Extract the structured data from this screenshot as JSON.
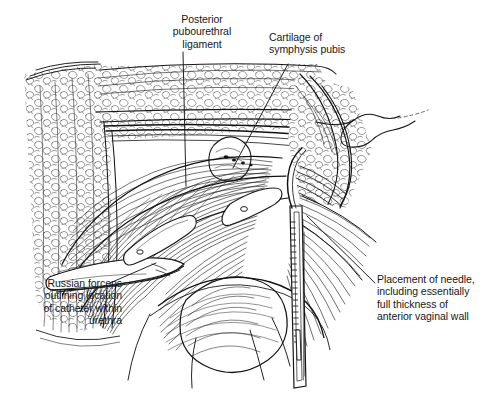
{
  "figure": {
    "style": "pen-and-ink line-hatching medical illustration",
    "background_color": "#ffffff",
    "ink_color": "#17171a",
    "width": 495,
    "height": 399
  },
  "labels": {
    "posterior_pubourethral_ligament": "Posterior\npubourethral\nligament",
    "cartilage_of_symphysis_pubis": "Cartilage of\nsymphysis pubis",
    "russian_forceps": "Russian forceps\noutlining location\nof catheter within\nurethra",
    "placement_of_needle": "Placement of needle,\nincluding essentially\nfull thickness of\nanterior vaginal wall"
  },
  "leader_lines": [
    {
      "name": "leader-posterior-pubourethral-ligament",
      "from": [
        183,
        52
      ],
      "to": [
        186,
        186
      ]
    },
    {
      "name": "leader-cartilage-of-symphysis-pubis",
      "from": [
        288,
        64
      ],
      "to": [
        233,
        168
      ]
    },
    {
      "name": "leader-russian-forceps",
      "from": [
        110,
        283
      ],
      "to": [
        156,
        263
      ]
    },
    {
      "name": "leader-placement-of-needle",
      "from": [
        375,
        283
      ],
      "to": [
        307,
        216
      ]
    }
  ],
  "anatomy": [
    "retropubic fatty tissue (cut edge, left)",
    "symphysis pubis cartilage",
    "posterior pubourethral ligament",
    "anterior vaginal wall",
    "urethra with catheter",
    "paravaginal tissue"
  ],
  "instruments": [
    "Russian forceps",
    "ligature carrier needle / trocar"
  ]
}
